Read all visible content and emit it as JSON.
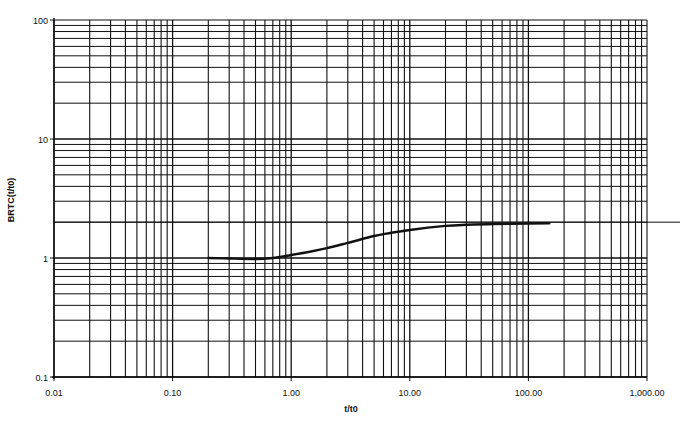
{
  "chart_data": {
    "type": "line",
    "title": "",
    "xlabel": "t/t0",
    "ylabel": "BRTC(t/t0)",
    "xscale": "log",
    "yscale": "log",
    "xlim": [
      0.01,
      1000
    ],
    "ylim": [
      0.1,
      100
    ],
    "grid": true,
    "legend": null,
    "x_ticks": [
      {
        "value": 0.01,
        "label": "0.01"
      },
      {
        "value": 0.1,
        "label": "0.10"
      },
      {
        "value": 1,
        "label": "1.00"
      },
      {
        "value": 10,
        "label": "10.00"
      },
      {
        "value": 100,
        "label": "100.00"
      },
      {
        "value": 1000,
        "label": "1,000.00"
      }
    ],
    "y_ticks": [
      {
        "value": 0.1,
        "label": "0.1"
      },
      {
        "value": 1,
        "label": "1"
      },
      {
        "value": 10,
        "label": "10"
      },
      {
        "value": 100,
        "label": "100"
      }
    ],
    "series": [
      {
        "name": "BRTC(t/t0)",
        "color": "#111111",
        "x": [
          0.2,
          0.3,
          0.5,
          0.7,
          1.0,
          1.5,
          2.0,
          3.0,
          5.0,
          7.0,
          10.0,
          20.0,
          30.0,
          50.0,
          100.0,
          150.0
        ],
        "y": [
          1.0,
          0.99,
          0.98,
          1.0,
          1.06,
          1.14,
          1.21,
          1.34,
          1.53,
          1.63,
          1.72,
          1.86,
          1.9,
          1.93,
          1.95,
          1.96
        ]
      }
    ],
    "extra_gridline_y": 2
  },
  "colors": {
    "grid": "#111111",
    "background": "#ffffff",
    "curve": "#111111"
  }
}
